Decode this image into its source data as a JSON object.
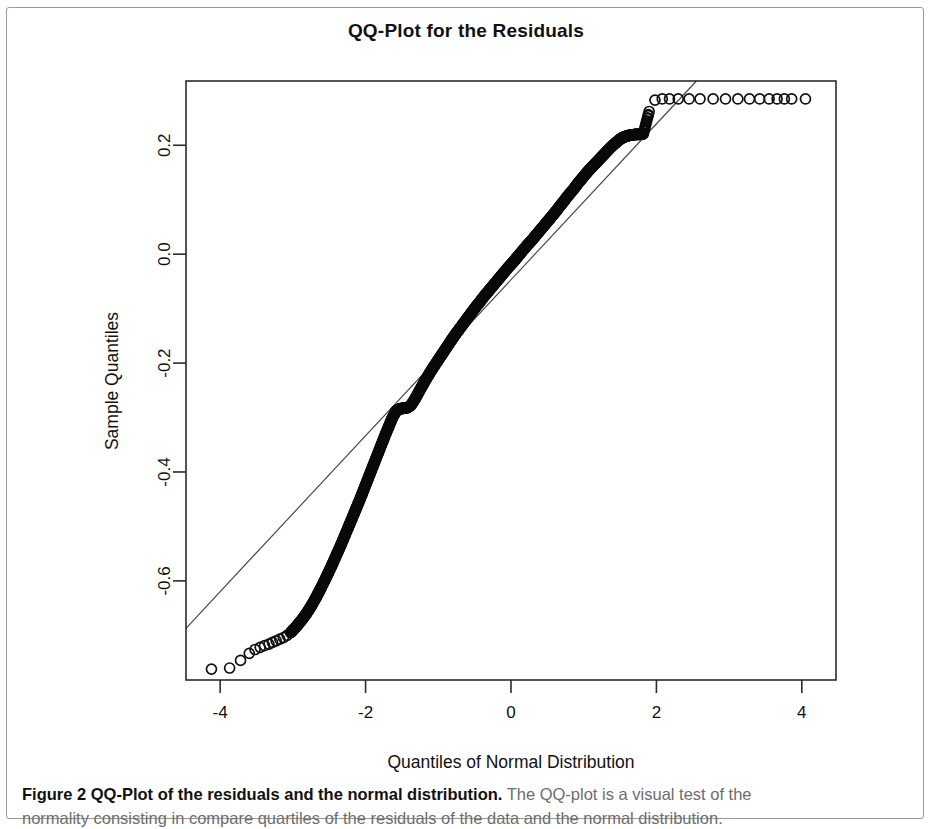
{
  "figure": {
    "caption_bold": "Figure 2 QQ-Plot of the residuals and the normal distribution.",
    "caption_rest": " The QQ-plot is a visual test of the",
    "caption_line2": "normality consisting in compare quartiles of the residuals of the data and the normal distribution."
  },
  "chart_data": {
    "type": "scatter",
    "title": "QQ-Plot for the Residuals",
    "xlabel": "Quantiles of Normal Distribution",
    "ylabel": "Sample Quantiles",
    "xticks": [
      -4,
      -2,
      0,
      2,
      4
    ],
    "yticks": [
      0.2,
      0.0,
      -0.2,
      -0.4,
      -0.6
    ],
    "xtick_labels": [
      "-4",
      "-2",
      "0",
      "2",
      "4"
    ],
    "ytick_labels": [
      "0.2",
      "0.0",
      "-0.2",
      "-0.4",
      "-0.6"
    ],
    "xlim": [
      -4.47,
      4.47
    ],
    "ylim": [
      -0.782,
      0.318
    ],
    "grid": false,
    "legend": null,
    "point_marker": "open-circle",
    "reference_line": {
      "name": "qqline",
      "x": [
        -4.47,
        2.55
      ],
      "y": [
        -0.687,
        0.318
      ],
      "slope": 0.1432,
      "intercept": -0.0468
    },
    "series": [
      {
        "name": "Sample Quantiles vs Theoretical Quantiles",
        "x": [
          -4.12,
          -3.87,
          -3.72,
          -3.6,
          -3.52,
          -3.45,
          -3.39,
          -3.33,
          -3.28,
          -3.23,
          -3.18,
          -3.13,
          -3.08,
          -3.03,
          -2.98,
          -2.93,
          -2.88,
          -2.83,
          -2.78,
          -2.73,
          -2.68,
          -2.63,
          -2.58,
          -2.53,
          -2.48,
          -2.43,
          -2.38,
          -2.33,
          -2.28,
          -2.23,
          -2.18,
          -2.13,
          -2.08,
          -2.03,
          -1.98,
          -1.93,
          -1.88,
          -1.83,
          -1.78,
          -1.73,
          -1.68,
          -1.63,
          -1.58,
          -1.53,
          -1.48,
          -1.43,
          -1.38,
          -1.33,
          -1.28,
          -1.23,
          -1.18,
          -1.13,
          -1.08,
          -1.03,
          -0.98,
          -0.93,
          -0.88,
          -0.83,
          -0.78,
          -0.73,
          -0.68,
          -0.63,
          -0.58,
          -0.53,
          -0.48,
          -0.43,
          -0.38,
          -0.33,
          -0.28,
          -0.23,
          -0.18,
          -0.13,
          -0.08,
          -0.03,
          0.02,
          0.07,
          0.12,
          0.17,
          0.22,
          0.27,
          0.32,
          0.37,
          0.42,
          0.47,
          0.52,
          0.57,
          0.62,
          0.67,
          0.72,
          0.77,
          0.82,
          0.87,
          0.92,
          0.97,
          1.02,
          1.07,
          1.12,
          1.17,
          1.22,
          1.27,
          1.32,
          1.37,
          1.42,
          1.47,
          1.52,
          1.57,
          1.62,
          1.67,
          1.72,
          1.77,
          1.82,
          1.9,
          1.98,
          2.08,
          2.18,
          2.3,
          2.45,
          2.6,
          2.78,
          2.95,
          3.12,
          3.28,
          3.42,
          3.55,
          3.66,
          3.76,
          3.86,
          4.05
        ],
        "y": [
          -0.762,
          -0.76,
          -0.746,
          -0.733,
          -0.726,
          -0.722,
          -0.719,
          -0.716,
          -0.713,
          -0.71,
          -0.707,
          -0.704,
          -0.7,
          -0.695,
          -0.688,
          -0.68,
          -0.672,
          -0.663,
          -0.653,
          -0.642,
          -0.63,
          -0.617,
          -0.604,
          -0.59,
          -0.576,
          -0.561,
          -0.546,
          -0.531,
          -0.515,
          -0.499,
          -0.483,
          -0.467,
          -0.451,
          -0.434,
          -0.417,
          -0.4,
          -0.383,
          -0.366,
          -0.349,
          -0.332,
          -0.316,
          -0.3,
          -0.288,
          -0.284,
          -0.283,
          -0.282,
          -0.278,
          -0.268,
          -0.256,
          -0.244,
          -0.232,
          -0.221,
          -0.21,
          -0.2,
          -0.19,
          -0.18,
          -0.17,
          -0.16,
          -0.15,
          -0.141,
          -0.132,
          -0.123,
          -0.114,
          -0.105,
          -0.096,
          -0.088,
          -0.079,
          -0.071,
          -0.063,
          -0.055,
          -0.047,
          -0.039,
          -0.031,
          -0.023,
          -0.016,
          -0.008,
          0.0,
          0.008,
          0.016,
          0.023,
          0.031,
          0.039,
          0.047,
          0.055,
          0.063,
          0.071,
          0.079,
          0.088,
          0.096,
          0.105,
          0.113,
          0.121,
          0.13,
          0.138,
          0.146,
          0.154,
          0.161,
          0.168,
          0.175,
          0.182,
          0.189,
          0.196,
          0.202,
          0.208,
          0.213,
          0.216,
          0.218,
          0.219,
          0.22,
          0.22,
          0.221,
          0.262,
          0.283,
          0.285,
          0.285,
          0.285,
          0.285,
          0.285,
          0.285,
          0.285,
          0.285,
          0.285,
          0.285,
          0.285,
          0.285,
          0.285,
          0.285,
          0.285
        ]
      }
    ],
    "dense_band": {
      "description": "saturated overplotted staircase band of residual quantiles",
      "x_start": -3.05,
      "x_end": 1.84
    }
  }
}
